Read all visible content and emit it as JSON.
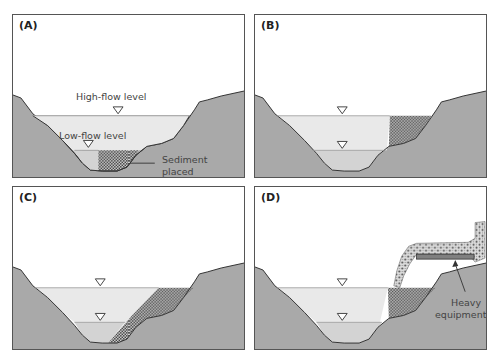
{
  "figure": {
    "panels": [
      {
        "id": "A",
        "label": "(A)",
        "annotations": {
          "high_flow": "High-flow level",
          "low_flow": "Low-flow level",
          "sediment_line1": "Sediment",
          "sediment_line2": "placed"
        }
      },
      {
        "id": "B",
        "label": "(B)"
      },
      {
        "id": "C",
        "label": "(C)"
      },
      {
        "id": "D",
        "label": "(D)",
        "annotations": {
          "equipment_line1": "Heavy",
          "equipment_line2": "equipment"
        }
      }
    ],
    "legend_symbols": {
      "water_level_marker": "inverted-triangle",
      "sediment_pattern": "dotted-checker"
    },
    "colors": {
      "ground": "#a9a9a9",
      "high_flow_water": "#e9e9e9",
      "low_flow_water": "#d3d3d3",
      "sediment": "#4a4a4a",
      "equipment": "#808080",
      "border": "#555555"
    }
  }
}
